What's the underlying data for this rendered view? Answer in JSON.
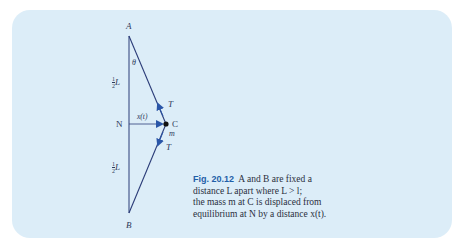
{
  "figure": {
    "number": "Fig. 20.12",
    "caption": "A and B are fixed a distance L apart where L > l; the mass m at C is displaced from equilibrium at N by a distance x(t).",
    "caption_lines": [
      "A and B are fixed a",
      "distance L apart where L > l;",
      "the mass m at C is displaced from",
      "equilibrium at N by a distance x(t)."
    ],
    "labels": {
      "A": "A",
      "B": "B",
      "N": "N",
      "C": "C",
      "m": "m",
      "theta": "θ",
      "T_upper": "T",
      "T_lower": "T",
      "x": "x(t)",
      "half_L_upper_num": "1",
      "half_L_upper_den": "2",
      "half_L_upper_var": "L",
      "half_L_lower_num": "1",
      "half_L_lower_den": "2",
      "half_L_lower_var": "L"
    },
    "colors": {
      "panel_background": "#dcedf8",
      "line": "#2b3c78",
      "arrow": "#2a56a8",
      "caption_title": "#1f5fa8"
    }
  }
}
